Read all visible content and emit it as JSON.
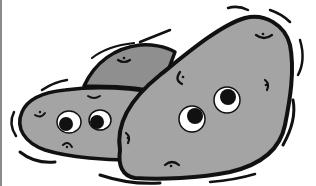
{
  "image": {
    "subject": "cartoon potatoes with eyes",
    "colors": {
      "background": "#ffffff",
      "potato_fill": "#a4a4a4",
      "back_potato_fill": "#8f8f8f",
      "outline": "#111111",
      "eye_white": "#ffffff",
      "pupil": "#111111",
      "border": "#8a8a8a"
    }
  }
}
